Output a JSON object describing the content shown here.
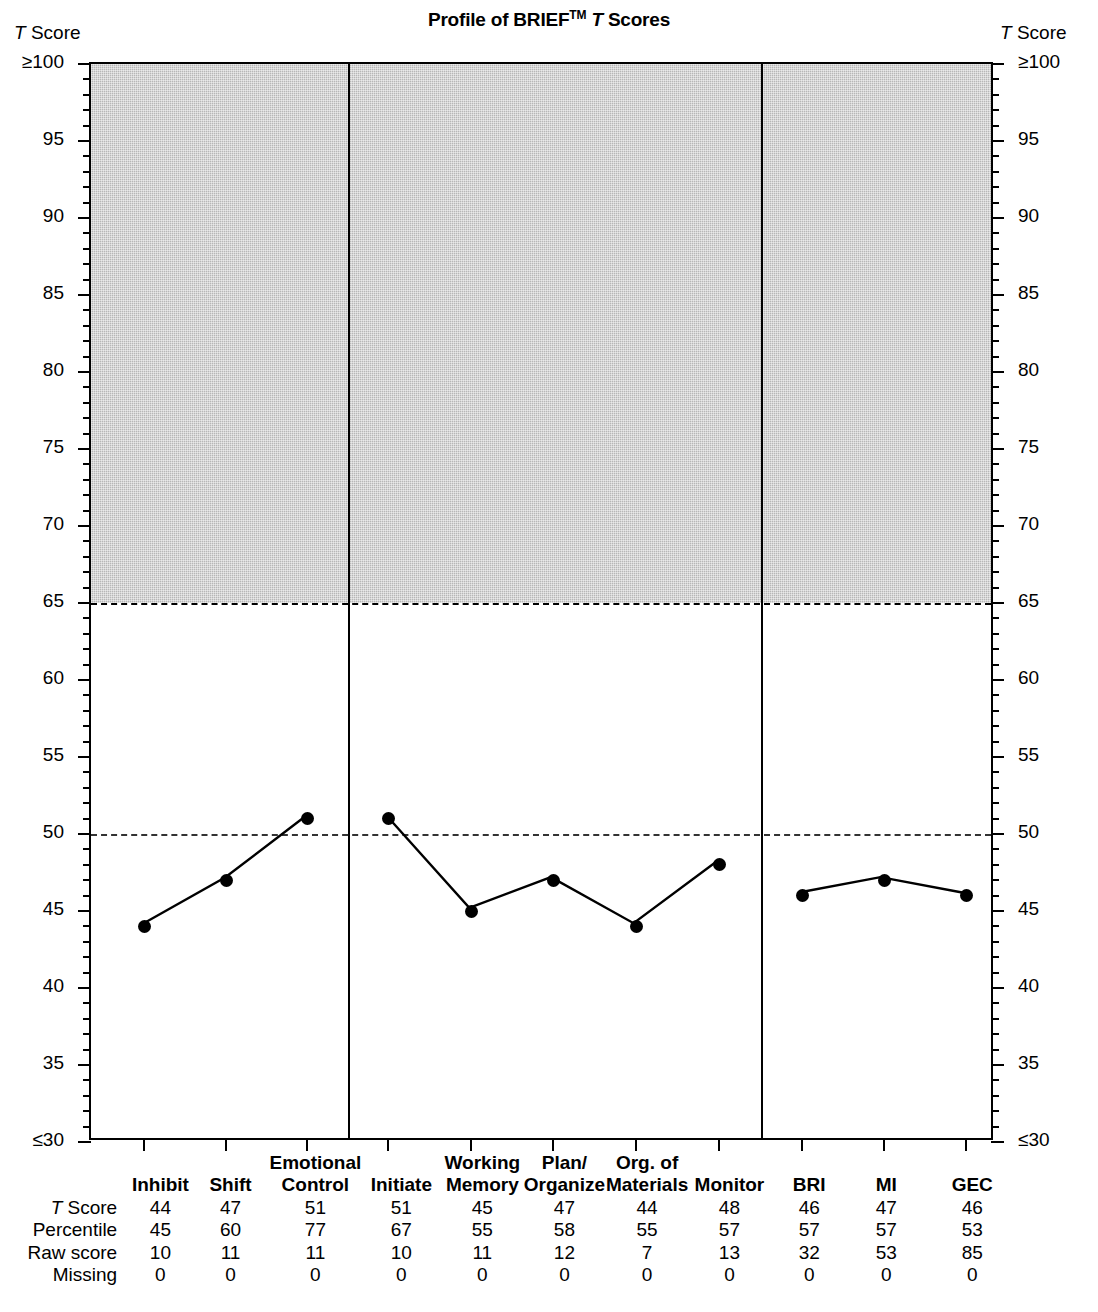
{
  "chart_data": {
    "type": "line",
    "title_parts": {
      "before": "Profile of BRIEF",
      "tm": "TM",
      "t": "T",
      "after": " Scores"
    },
    "ylabel": "T Score",
    "xlabel": "",
    "ylim": [
      30,
      100
    ],
    "ytick_labels": [
      "≥100",
      "95",
      "90",
      "85",
      "80",
      "75",
      "70",
      "65",
      "60",
      "55",
      "50",
      "45",
      "40",
      "35",
      "≤30"
    ],
    "ytick_values": [
      100,
      95,
      90,
      85,
      80,
      75,
      70,
      65,
      60,
      55,
      50,
      45,
      40,
      35,
      30
    ],
    "minor_tick_step": 1,
    "grid": false,
    "legend": "none",
    "reference_lines": [
      {
        "value": 65,
        "style": "dashed",
        "label": "clinical cutoff"
      },
      {
        "value": 50,
        "style": "dashed",
        "label": "normative mean"
      }
    ],
    "shaded_region": {
      "from": 65,
      "to": 100,
      "color": "#b7b7b7"
    },
    "section_dividers_after": [
      "Emotional Control",
      "Monitor"
    ],
    "categories": [
      "Inhibit",
      "Shift",
      "Emotional Control",
      "Initiate",
      "Working Memory",
      "Plan/Organize",
      "Org. of Materials",
      "Monitor",
      "BRI",
      "MI",
      "GEC"
    ],
    "series": [
      {
        "name": "T Score",
        "values": [
          44,
          47,
          51,
          51,
          45,
          47,
          44,
          48,
          46,
          47,
          46
        ],
        "segments": [
          [
            0,
            1,
            2
          ],
          [
            3,
            4,
            5,
            6,
            7
          ],
          [
            8,
            9,
            10
          ]
        ]
      }
    ]
  },
  "axis_captions": {
    "left": {
      "t": "T",
      "rest": " Score"
    },
    "right": {
      "t": "T",
      "rest": " Score"
    }
  },
  "table": {
    "column_headers": [
      {
        "line1": "",
        "line2": "Inhibit"
      },
      {
        "line1": "",
        "line2": "Shift"
      },
      {
        "line1": "Emotional",
        "line2": "Control"
      },
      {
        "line1": "",
        "line2": "Initiate"
      },
      {
        "line1": "Working",
        "line2": "Memory"
      },
      {
        "line1": "Plan/",
        "line2": "Organize"
      },
      {
        "line1": "Org. of",
        "line2": "Materials"
      },
      {
        "line1": "",
        "line2": "Monitor"
      },
      {
        "line1": "",
        "line2": "BRI"
      },
      {
        "line1": "",
        "line2": "MI"
      },
      {
        "line1": "",
        "line2": "GEC"
      }
    ],
    "rows": [
      {
        "label_italic": "T",
        "label_rest": " Score",
        "values": [
          "44",
          "47",
          "51",
          "51",
          "45",
          "47",
          "44",
          "48",
          "46",
          "47",
          "46"
        ]
      },
      {
        "label_italic": "",
        "label_rest": "Percentile",
        "values": [
          "45",
          "60",
          "77",
          "67",
          "55",
          "58",
          "55",
          "57",
          "57",
          "57",
          "53"
        ]
      },
      {
        "label_italic": "",
        "label_rest": "Raw score",
        "values": [
          "10",
          "11",
          "11",
          "10",
          "11",
          "12",
          "7",
          "13",
          "32",
          "53",
          "85"
        ]
      },
      {
        "label_italic": "",
        "label_rest": "Missing",
        "values": [
          "0",
          "0",
          "0",
          "0",
          "0",
          "0",
          "0",
          "0",
          "0",
          "0",
          "0"
        ]
      }
    ]
  }
}
